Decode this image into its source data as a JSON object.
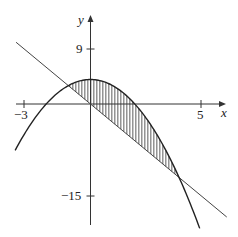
{
  "chart_data": {
    "type": "line",
    "title": "",
    "xlabel": "x",
    "ylabel": "y",
    "xlim": [
      -3.4,
      6.2
    ],
    "ylim": [
      -19.9,
      14
    ],
    "x_ticks": [
      {
        "value": -3,
        "label": "−3"
      },
      {
        "value": 5,
        "label": "5"
      }
    ],
    "y_ticks": [
      {
        "value": 9,
        "label": "9"
      },
      {
        "value": -15,
        "label": "−15"
      }
    ],
    "grid": false,
    "legend": null,
    "series": [
      {
        "name": "parabola",
        "equation": "y = 4 - x^2",
        "x_range": [
          -3.4,
          4.93
        ]
      },
      {
        "name": "line",
        "equation": "y = -3x",
        "x_range": [
          -3.36,
          6.15
        ]
      }
    ],
    "shaded_region": {
      "between": [
        "parabola",
        "line"
      ],
      "x_range": [
        -1,
        4
      ],
      "style": "vertical-hatch",
      "intersections": [
        {
          "x": -1,
          "y": 3
        },
        {
          "x": 4,
          "y": -12
        }
      ]
    }
  },
  "axes": {
    "x_label": "x",
    "y_label": "y",
    "x_tick_labels": [
      "−3",
      "5"
    ],
    "y_tick_labels": [
      "9",
      "−15"
    ]
  },
  "colors": {
    "curve": "#222222",
    "line": "#444444",
    "axis": "#333333",
    "hatch": "#333333"
  }
}
